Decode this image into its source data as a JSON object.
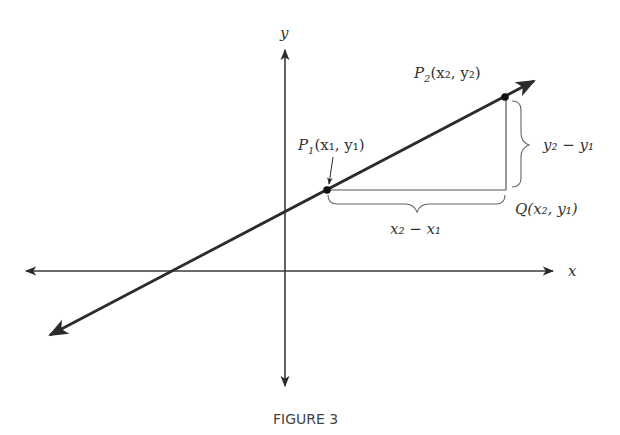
{
  "figure": {
    "caption": "FIGURE 3",
    "axes": {
      "x_label": "x",
      "y_label": "y"
    },
    "points": {
      "p1": {
        "name": "P",
        "sub": "1",
        "coords": "(x₁, y₁)"
      },
      "p2": {
        "name": "P",
        "sub": "2",
        "coords": "(x₂, y₂)"
      },
      "q": {
        "label": "Q(x₂, y₁)"
      }
    },
    "braces": {
      "horizontal": {
        "label": "x₂ − x₁"
      },
      "vertical": {
        "label": "y₂ − y₁"
      }
    },
    "colors": {
      "line": "#2b2b2b",
      "axis": "#3a3a3a",
      "text": "#333333"
    }
  }
}
